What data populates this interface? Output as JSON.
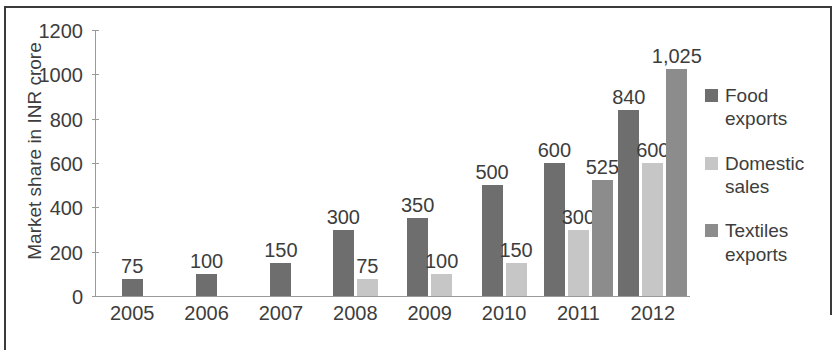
{
  "chart_data": {
    "type": "bar",
    "title": "",
    "subtitle": "",
    "xlabel": "",
    "ylabel": "Market share in INR crore",
    "categories": [
      "2005",
      "2006",
      "2007",
      "2008",
      "2009",
      "2010",
      "2011",
      "2012"
    ],
    "series": [
      {
        "name": "Food exports",
        "color": "#6e6e6e",
        "values": [
          75,
          100,
          150,
          300,
          350,
          500,
          600,
          840
        ],
        "labels": [
          "75",
          "100",
          "150",
          "300",
          "350",
          "500",
          "600",
          "840"
        ]
      },
      {
        "name": "Domestic sales",
        "color": "#c6c6c6",
        "values": [
          null,
          null,
          null,
          75,
          100,
          150,
          300,
          600
        ],
        "labels": [
          "",
          "",
          "",
          "75",
          "100",
          "150",
          "300",
          "600"
        ]
      },
      {
        "name": "Textiles exports",
        "color": "#8c8c8c",
        "values": [
          null,
          null,
          null,
          null,
          null,
          null,
          525,
          1025
        ],
        "labels": [
          "",
          "",
          "",
          "",
          "",
          "",
          "525",
          "1,025"
        ]
      }
    ],
    "ylim": [
      0,
      1200
    ],
    "ytick_labels": [
      "1200",
      "1000",
      "800",
      "600",
      "400",
      "200",
      "0"
    ],
    "ytick_values": [
      1200,
      1000,
      800,
      600,
      400,
      200,
      0
    ],
    "grid": false,
    "legend_position": "right"
  },
  "legend": {
    "items": [
      {
        "label": "Food exports"
      },
      {
        "label": "Domestic sales"
      },
      {
        "label": "Textiles exports"
      }
    ]
  }
}
